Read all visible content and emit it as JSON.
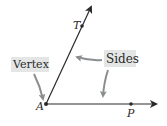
{
  "diagram": {
    "type": "angle",
    "vertex": {
      "label": "A",
      "x": 46,
      "y": 104
    },
    "points": [
      {
        "label": "T",
        "x": 82,
        "y": 26
      },
      {
        "label": "P",
        "x": 131,
        "y": 104
      }
    ],
    "rays": [
      {
        "name": "ray-AT",
        "from": [
          46,
          104
        ],
        "to": [
          92,
          5
        ]
      },
      {
        "name": "ray-AP",
        "from": [
          46,
          104
        ],
        "to": [
          157,
          104
        ]
      }
    ],
    "callouts": {
      "vertex": {
        "text": "Vertex"
      },
      "sides": {
        "text": "Sides"
      }
    },
    "colors": {
      "line": "#2a2a2a",
      "callout_box": "#e4e6e6",
      "callout_arrow": "#8a8e90",
      "background": "#ffffff"
    }
  }
}
